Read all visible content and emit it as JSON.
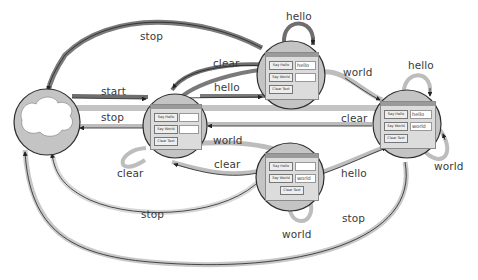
{
  "diagram": {
    "type": "state-transition",
    "states": [
      {
        "id": "initial",
        "kind": "cloud",
        "label": ""
      },
      {
        "id": "s_empty",
        "kind": "window",
        "buttons": [
          "Say Hello",
          "Say World",
          "Clear Text"
        ],
        "hello_field": "",
        "world_field": ""
      },
      {
        "id": "s_hello",
        "kind": "window",
        "buttons": [
          "Say Hello",
          "Say World",
          "Clear Text"
        ],
        "hello_field": "hello",
        "world_field": ""
      },
      {
        "id": "s_world",
        "kind": "window",
        "buttons": [
          "Say Hello",
          "Say World",
          "Clear Text"
        ],
        "hello_field": "",
        "world_field": "world"
      },
      {
        "id": "s_both",
        "kind": "window",
        "buttons": [
          "Say Hello",
          "Say World",
          "Clear Text"
        ],
        "hello_field": "hello",
        "world_field": "world"
      }
    ],
    "transitions": [
      {
        "from": "initial",
        "to": "s_empty",
        "label": "start"
      },
      {
        "from": "s_empty",
        "to": "initial",
        "label": "stop"
      },
      {
        "from": "s_hello",
        "to": "initial",
        "label": "stop"
      },
      {
        "from": "s_world",
        "to": "initial",
        "label": "stop"
      },
      {
        "from": "s_both",
        "to": "initial",
        "label": "stop"
      },
      {
        "from": "s_empty",
        "to": "s_hello",
        "label": "hello"
      },
      {
        "from": "s_hello",
        "to": "s_empty",
        "label": "clear"
      },
      {
        "from": "s_hello",
        "to": "s_hello",
        "label": "hello"
      },
      {
        "from": "s_hello",
        "to": "s_both",
        "label": "world"
      },
      {
        "from": "s_empty",
        "to": "s_world",
        "label": "world"
      },
      {
        "from": "s_world",
        "to": "s_empty",
        "label": "clear"
      },
      {
        "from": "s_world",
        "to": "s_world",
        "label": "world"
      },
      {
        "from": "s_world",
        "to": "s_both",
        "label": "hello"
      },
      {
        "from": "s_both",
        "to": "s_empty",
        "label": "clear"
      },
      {
        "from": "s_both",
        "to": "s_both",
        "label": "hello"
      },
      {
        "from": "s_both",
        "to": "s_both",
        "label": "world"
      },
      {
        "from": "s_empty",
        "to": "s_empty",
        "label": "clear"
      }
    ]
  },
  "labels": {
    "stop_top": "stop",
    "start": "start",
    "stop_mid": "stop",
    "clear_top": "clear",
    "hello_mid": "hello",
    "hello_loop_top": "hello",
    "world_top_right": "world",
    "hello_loop_right": "hello",
    "clear_right": "clear",
    "world_center": "world",
    "clear_center": "clear",
    "clear_loop_left": "clear",
    "hello_bottom_right": "hello",
    "world_loop_right": "world",
    "stop_bottom_inner": "stop",
    "world_loop_bottom": "world",
    "stop_bottom_outer": "stop"
  },
  "window": {
    "btn_hello": "Say Hello",
    "btn_world": "Say World",
    "btn_clear": "Clear Text",
    "val_hello": "hello",
    "val_world": "world"
  },
  "colors": {
    "node_fill": "#c4c4c4",
    "node_stroke": "#2e2e2e",
    "edge_dark": "#6e6e6e",
    "edge_light": "#bdbdbd",
    "text": "#3a3a3a"
  }
}
